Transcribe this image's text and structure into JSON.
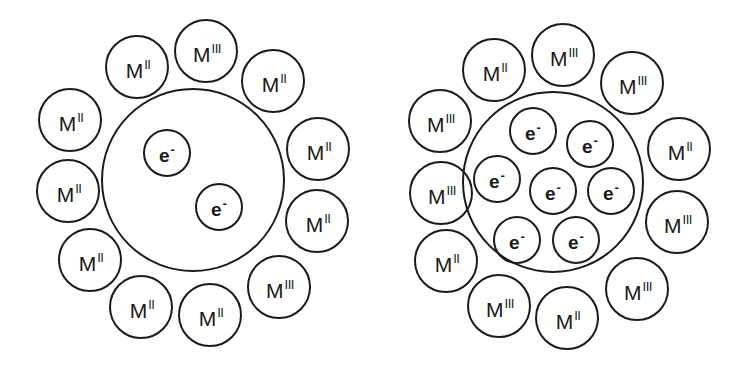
{
  "colors": {
    "stroke": "#1a1a1a",
    "background": "#ffffff"
  },
  "diagrams": [
    {
      "name": "left-cluster",
      "core": {
        "cx": 193,
        "cy": 180,
        "r": 92
      },
      "metals": [
        {
          "cx": 70,
          "cy": 120,
          "base": "M",
          "ox": "II"
        },
        {
          "cx": 137,
          "cy": 67,
          "base": "M",
          "ox": "II"
        },
        {
          "cx": 206,
          "cy": 51,
          "base": "M",
          "ox": "III"
        },
        {
          "cx": 273,
          "cy": 81,
          "base": "M",
          "ox": "II"
        },
        {
          "cx": 318,
          "cy": 149,
          "base": "M",
          "ox": "II"
        },
        {
          "cx": 317,
          "cy": 221,
          "base": "M",
          "ox": "II"
        },
        {
          "cx": 279,
          "cy": 287,
          "base": "M",
          "ox": "III"
        },
        {
          "cx": 210,
          "cy": 315,
          "base": "M",
          "ox": "II"
        },
        {
          "cx": 141,
          "cy": 307,
          "base": "M",
          "ox": "II"
        },
        {
          "cx": 90,
          "cy": 260,
          "base": "M",
          "ox": "II"
        },
        {
          "cx": 68,
          "cy": 191,
          "base": "M",
          "ox": "II"
        }
      ],
      "electrons": [
        {
          "cx": 167,
          "cy": 153,
          "base": "e",
          "charge": "-"
        },
        {
          "cx": 219,
          "cy": 207,
          "base": "e",
          "charge": "-"
        }
      ]
    },
    {
      "name": "right-cluster",
      "core": {
        "cx": 553,
        "cy": 182,
        "r": 91
      },
      "metals": [
        {
          "cx": 440,
          "cy": 121,
          "base": "M",
          "ox": "III"
        },
        {
          "cx": 494,
          "cy": 70,
          "base": "M",
          "ox": "II"
        },
        {
          "cx": 563,
          "cy": 55,
          "base": "M",
          "ox": "III"
        },
        {
          "cx": 632,
          "cy": 83,
          "base": "M",
          "ox": "III"
        },
        {
          "cx": 679,
          "cy": 149,
          "base": "M",
          "ox": "II"
        },
        {
          "cx": 677,
          "cy": 222,
          "base": "M",
          "ox": "III"
        },
        {
          "cx": 637,
          "cy": 289,
          "base": "M",
          "ox": "III"
        },
        {
          "cx": 567,
          "cy": 318,
          "base": "M",
          "ox": "II"
        },
        {
          "cx": 499,
          "cy": 306,
          "base": "M",
          "ox": "III"
        },
        {
          "cx": 446,
          "cy": 261,
          "base": "M",
          "ox": "II"
        },
        {
          "cx": 441,
          "cy": 193,
          "base": "M",
          "ox": "III"
        }
      ],
      "electrons": [
        {
          "cx": 533,
          "cy": 131,
          "base": "e",
          "charge": "-"
        },
        {
          "cx": 590,
          "cy": 144,
          "base": "e",
          "charge": "-"
        },
        {
          "cx": 497,
          "cy": 179,
          "base": "e",
          "charge": "-"
        },
        {
          "cx": 553,
          "cy": 191,
          "base": "e",
          "charge": "-"
        },
        {
          "cx": 611,
          "cy": 191,
          "base": "e",
          "charge": "-"
        },
        {
          "cx": 517,
          "cy": 240,
          "base": "e",
          "charge": "-"
        },
        {
          "cx": 576,
          "cy": 240,
          "base": "e",
          "charge": "-"
        }
      ]
    }
  ],
  "sizes": {
    "metal_r": 32,
    "electron_r": 24
  }
}
